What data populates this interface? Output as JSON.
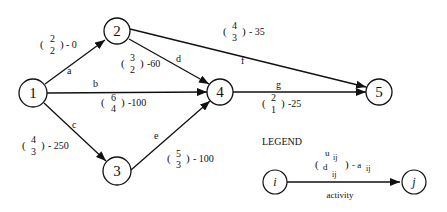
{
  "diagram": {
    "type": "activity-network",
    "nodes": [
      {
        "id": "1",
        "label": "1",
        "x": 33,
        "y": 93
      },
      {
        "id": "2",
        "label": "2",
        "x": 117,
        "y": 31
      },
      {
        "id": "3",
        "label": "3",
        "x": 117,
        "y": 171
      },
      {
        "id": "4",
        "label": "4",
        "x": 220,
        "y": 92
      },
      {
        "id": "5",
        "label": "5",
        "x": 379,
        "y": 92
      }
    ],
    "edges": [
      {
        "activity": "a",
        "from": "1",
        "to": "2",
        "u": "2",
        "d": "2",
        "cost": "- 0"
      },
      {
        "activity": "b",
        "from": "1",
        "to": "4",
        "u": "6",
        "d": "4",
        "cost": "-100"
      },
      {
        "activity": "c",
        "from": "1",
        "to": "3",
        "u": "4",
        "d": "3",
        "cost": "- 250"
      },
      {
        "activity": "d",
        "from": "2",
        "to": "4",
        "u": "3",
        "d": "2",
        "cost": "-60"
      },
      {
        "activity": "e",
        "from": "3",
        "to": "4",
        "u": "5",
        "d": "3",
        "cost": "- 100"
      },
      {
        "activity": "f",
        "from": "2",
        "to": "5",
        "u": "4",
        "d": "3",
        "cost": "- 35"
      },
      {
        "activity": "g",
        "from": "4",
        "to": "5",
        "u": "2",
        "d": "1",
        "cost": "-25"
      }
    ]
  },
  "legend": {
    "title": "LEGEND",
    "node_i": "i",
    "node_j": "j",
    "u": "u",
    "u_sub": "ij",
    "d": "d",
    "d_sub": "ij",
    "cost_prefix": "- a",
    "cost_sub": "ij",
    "edge_label": "activity"
  }
}
